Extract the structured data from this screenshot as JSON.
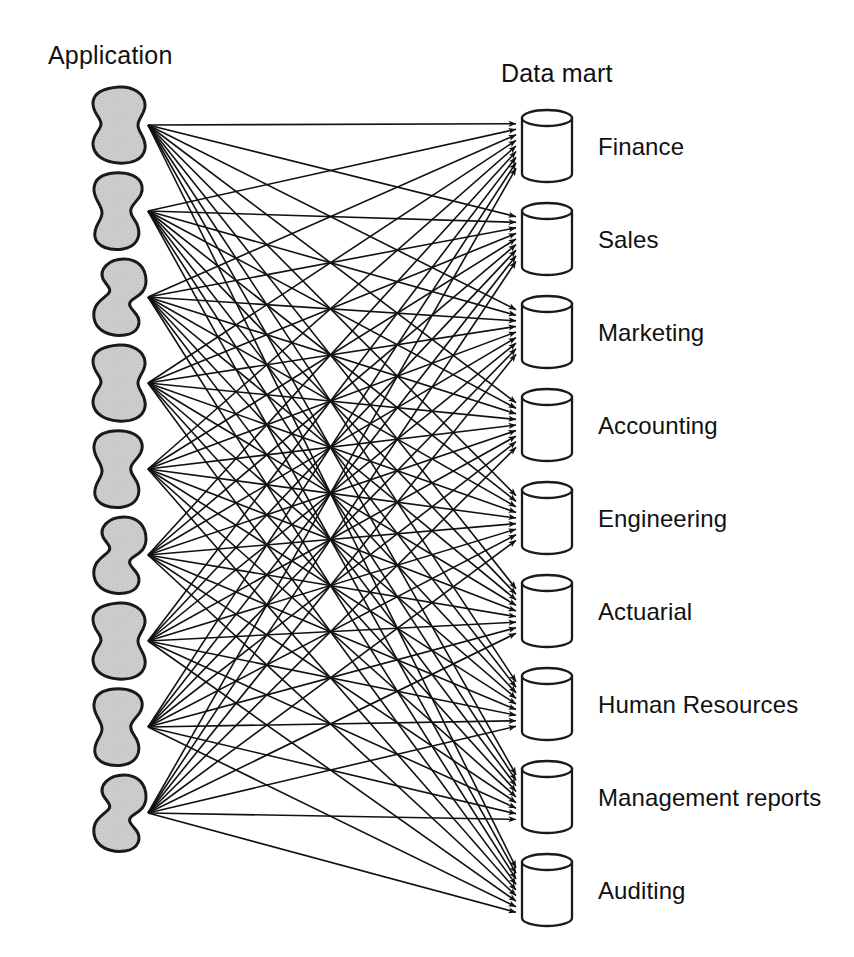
{
  "figure": {
    "kind": "spaghetti-architecture-diagram",
    "background_color": "#ffffff",
    "ink_color": "#111111",
    "blob_fill_color": "#d2d2d2",
    "blob_stroke_color": "#1a1a1a",
    "cylinder_fill_color": "#ffffff",
    "cylinder_stroke_color": "#1a1a1a"
  },
  "headings": {
    "left": "Application",
    "right": "Data mart"
  },
  "applications": [
    {
      "index": 1,
      "name": "application-blob-1",
      "variant": "peanut"
    },
    {
      "index": 2,
      "name": "application-blob-2",
      "variant": "boot"
    },
    {
      "index": 3,
      "name": "application-blob-3",
      "variant": "bean"
    },
    {
      "index": 4,
      "name": "application-blob-4",
      "variant": "peanut"
    },
    {
      "index": 5,
      "name": "application-blob-5",
      "variant": "boot"
    },
    {
      "index": 6,
      "name": "application-blob-6",
      "variant": "bean"
    },
    {
      "index": 7,
      "name": "application-blob-7",
      "variant": "peanut"
    },
    {
      "index": 8,
      "name": "application-blob-8",
      "variant": "boot"
    },
    {
      "index": 9,
      "name": "application-blob-9",
      "variant": "bean"
    }
  ],
  "data_marts": [
    {
      "index": 1,
      "label": "Finance"
    },
    {
      "index": 2,
      "label": "Sales"
    },
    {
      "index": 3,
      "label": "Marketing"
    },
    {
      "index": 4,
      "label": "Accounting"
    },
    {
      "index": 5,
      "label": "Engineering"
    },
    {
      "index": 6,
      "label": "Actuarial"
    },
    {
      "index": 7,
      "label": "Human Resources"
    },
    {
      "index": 8,
      "label": "Management reports"
    },
    {
      "index": 9,
      "label": "Auditing"
    }
  ],
  "chart_data": {
    "type": "diagram",
    "layout": "bipartite fully-connected mesh, arrows point left to right",
    "source_count": 9,
    "target_count": 9,
    "edge_count": 81,
    "sources": [
      "Application 1",
      "Application 2",
      "Application 3",
      "Application 4",
      "Application 5",
      "Application 6",
      "Application 7",
      "Application 8",
      "Application 9"
    ],
    "targets": [
      "Finance",
      "Sales",
      "Marketing",
      "Accounting",
      "Engineering",
      "Actuarial",
      "Human Resources",
      "Management reports",
      "Auditing"
    ],
    "edges_per_source": [
      9,
      9,
      9,
      9,
      9,
      9,
      9,
      9,
      9
    ]
  },
  "geometry": {
    "blob_origin_x": 148,
    "blob_first_center_y": 125,
    "blob_spacing_y": 86,
    "arrow_target_x": 516,
    "cylinder_x": 522,
    "cylinder_width": 50,
    "cylinder_height": 72,
    "cylinder_first_top_y": 110,
    "cylinder_spacing_y": 93,
    "label_x": 598
  }
}
